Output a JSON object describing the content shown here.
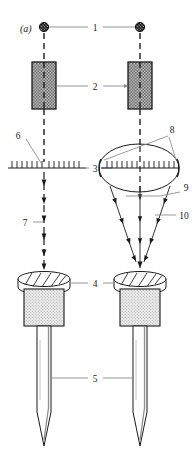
{
  "figure": {
    "panel_label": "(a)",
    "caption_present": false,
    "background_color": "#ffffff",
    "ink_color": "#1a1a1a",
    "callout_line_color": "#8a8a8a"
  },
  "callouts": [
    {
      "id": "c1",
      "label": "1",
      "x": 95,
      "y": 27,
      "refers_to": "horizontal-tie-line-between-markers"
    },
    {
      "id": "c2",
      "label": "2",
      "x": 95,
      "y": 86,
      "refers_to": "shaded-block-pair"
    },
    {
      "id": "c3",
      "label": "3",
      "x": 94,
      "y": 168,
      "refers_to": "scale-bar-axis"
    },
    {
      "id": "c4",
      "label": "4",
      "x": 95,
      "y": 283,
      "refers_to": "knurled-head-pair"
    },
    {
      "id": "c5",
      "label": "5",
      "x": 95,
      "y": 378,
      "refers_to": "probe-shank-pair"
    },
    {
      "id": "c6",
      "label": "6",
      "x": 18,
      "y": 136,
      "refers_to": "left-scale-graduations"
    },
    {
      "id": "c7",
      "label": "7",
      "x": 22,
      "y": 222,
      "refers_to": "left-parallel-beam"
    },
    {
      "id": "c8",
      "label": "8",
      "x": 172,
      "y": 132,
      "refers_to": "ellipse-aperture-edges"
    },
    {
      "id": "c9",
      "label": "9",
      "x": 185,
      "y": 190,
      "refers_to": "converging-cone-boundary"
    },
    {
      "id": "c10",
      "label": "10",
      "x": 182,
      "y": 214,
      "refers_to": "oblique-converging-ray"
    }
  ],
  "elements": {
    "markers": {
      "name": "filled-dot-pair",
      "count": 2,
      "left_x": 44,
      "right_x": 140,
      "y": 27,
      "radius": 4.6
    },
    "blocks": {
      "name": "stippled-block-pair",
      "count": 2,
      "width": 23,
      "height": 46,
      "top": 62,
      "fill": "#a8a8a8"
    },
    "scale_left": {
      "name": "graduated-scale-bar",
      "x1": 8,
      "x2": 82,
      "y": 168,
      "tick_count": 15
    },
    "ellipse": {
      "name": "aperture-ellipse",
      "cx": 139,
      "cy": 168,
      "rx": 40,
      "ry": 24
    },
    "heads": {
      "name": "knurled-head",
      "count": 2,
      "top": 272,
      "ellipse_ry": 7
    },
    "bodies": {
      "name": "stippled-body",
      "count": 2,
      "top": 288,
      "height": 36,
      "fill": "#d8d8d8"
    },
    "shanks": {
      "name": "pointed-shank",
      "count": 2,
      "top": 324,
      "bottom": 446,
      "width": 14
    }
  },
  "beams": {
    "left": {
      "name": "parallel-beam",
      "style": "dashed-vertical-with-arrowheads",
      "direction": "downward",
      "x": 44
    },
    "right": {
      "name": "converging-beam",
      "style": "three-rays-with-arrowheads",
      "direction": "downward-converging",
      "focus_x": 140,
      "focus_y": 262
    }
  }
}
